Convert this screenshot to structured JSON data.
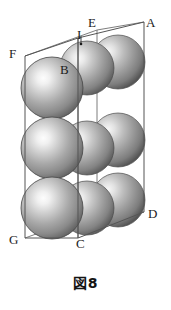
{
  "figure": {
    "caption": "図8",
    "type": "crystal-unit-cell-diagram",
    "colors": {
      "sphere_highlight": "#f2f2f2",
      "sphere_mid": "#9a9a9a",
      "sphere_dark": "#4a4a4a",
      "sphere_edge": "#3a3a3a",
      "box_line": "#5a5a5a",
      "background": "#ffffff",
      "label_text": "#1c1c1c"
    },
    "vertices": [
      {
        "id": "A",
        "label": "A",
        "x": 146,
        "y": 16
      },
      {
        "id": "E",
        "label": "E",
        "x": 88,
        "y": 16
      },
      {
        "id": "I",
        "label": "I",
        "x": 77,
        "y": 30
      },
      {
        "id": "F",
        "label": "F",
        "x": 9,
        "y": 47
      },
      {
        "id": "B",
        "label": "B",
        "x": 60,
        "y": 63
      },
      {
        "id": "D",
        "label": "D",
        "x": 148,
        "y": 207
      },
      {
        "id": "C",
        "label": "C",
        "x": 76,
        "y": 237
      },
      {
        "id": "G",
        "label": "G",
        "x": 9,
        "y": 233
      }
    ],
    "box_geometry": {
      "front_top_left": [
        25,
        56
      ],
      "front_top_right": [
        78,
        38
      ],
      "back_top_left": [
        97,
        30
      ],
      "back_top_right": [
        144,
        22
      ],
      "front_bot_left": [
        25,
        238
      ],
      "front_bot_right": [
        78,
        238
      ],
      "back_bot_right": [
        144,
        212
      ]
    },
    "spheres": {
      "rows": 3,
      "columns": 3,
      "total_visible": 9,
      "radius_front": 30,
      "radius_back": 26
    }
  }
}
